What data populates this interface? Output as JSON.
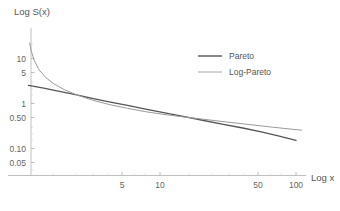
{
  "chart_data": {
    "type": "line",
    "title": "",
    "subtitle": "",
    "xlabel": "Log x",
    "ylabel": "Log S(x)",
    "xscale": "log",
    "yscale": "log",
    "grid": false,
    "legend_position": "top-right",
    "xlim": [
      1,
      115
    ],
    "ylim": [
      0.038,
      26
    ],
    "xticks": [
      5,
      10,
      50,
      100
    ],
    "xtick_labels": [
      "5",
      "10",
      "50",
      "100"
    ],
    "yticks": [
      10,
      5,
      1,
      0.5,
      0.1,
      0.05
    ],
    "ytick_labels": [
      "10",
      "5",
      "1",
      "0.50",
      "0.10",
      "0.05"
    ],
    "series": [
      {
        "name": "Pareto",
        "color": "#555555",
        "width": 1.3,
        "x": [
          1.0,
          1.3,
          1.7,
          2.2,
          3.0,
          4.0,
          5.5,
          7.5,
          10.0,
          14.0,
          20.0,
          28.0,
          40.0,
          55.0,
          75.0,
          100.0
        ],
        "y": [
          2.55,
          2.21,
          1.88,
          1.6,
          1.31,
          1.1,
          0.92,
          0.76,
          0.64,
          0.53,
          0.43,
          0.355,
          0.29,
          0.237,
          0.192,
          0.155
        ]
      },
      {
        "name": "Log-Pareto",
        "color": "#9a9a9a",
        "width": 1.0,
        "x": [
          1.02,
          1.05,
          1.1,
          1.2,
          1.35,
          1.55,
          1.85,
          2.3,
          3.0,
          4.0,
          5.5,
          7.5,
          10.0,
          14.0,
          20.0,
          30.0,
          45.0,
          65.0,
          90.0,
          110.0
        ],
        "y": [
          22.0,
          14.5,
          9.2,
          5.6,
          3.75,
          2.75,
          2.05,
          1.56,
          1.2,
          0.96,
          0.79,
          0.665,
          0.585,
          0.515,
          0.455,
          0.395,
          0.345,
          0.305,
          0.275,
          0.26
        ]
      }
    ],
    "legend": [
      {
        "label": "Pareto",
        "color": "#555555",
        "width": 1.4
      },
      {
        "label": "Log-Pareto",
        "color": "#a8a8a8",
        "width": 1.0
      }
    ],
    "axis_color": "#b8b8b8"
  }
}
